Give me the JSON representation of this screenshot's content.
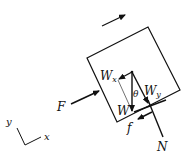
{
  "diagram": {
    "type": "free-body diagram",
    "colors": {
      "stroke": "#111111",
      "background": "#ffffff"
    },
    "labels": {
      "force_applied": "F",
      "weight": "W",
      "weight_x": "W",
      "weight_x_sub": "x",
      "weight_y": "W",
      "weight_y_sub": "y",
      "angle": "θ",
      "friction": "f",
      "normal": "N",
      "axis_x": "x",
      "axis_y": "y"
    },
    "elements": [
      "motion-direction-arrow",
      "block",
      "applied-force-F",
      "weight-W",
      "weight-component-Wx",
      "weight-component-Wy",
      "angle-theta",
      "friction-f",
      "normal-force-N",
      "surface-line",
      "axes"
    ]
  }
}
